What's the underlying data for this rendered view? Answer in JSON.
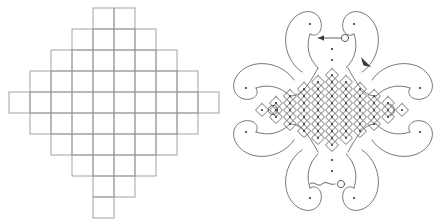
{
  "figure": {
    "title": "Stepped square grid and kolam loop design",
    "background_color": "#ffffff",
    "width": 443,
    "height": 222,
    "panel_count": 2
  },
  "left_panel": {
    "name": "stepped-square-grid",
    "description": "Diamond-shaped stepped arrangement of unit squares",
    "line_color": "#9a9a9a",
    "cell_size": 21,
    "origin_x": 9,
    "origin_y": 8,
    "columns": 10,
    "rows": 10,
    "row_spans": [
      {
        "row": 0,
        "start_col": 4,
        "span": 2
      },
      {
        "row": 1,
        "start_col": 3,
        "span": 4
      },
      {
        "row": 2,
        "start_col": 2,
        "span": 6
      },
      {
        "row": 3,
        "start_col": 1,
        "span": 8
      },
      {
        "row": 4,
        "start_col": 0,
        "span": 10
      },
      {
        "row": 5,
        "start_col": 1,
        "span": 8
      },
      {
        "row": 6,
        "start_col": 2,
        "span": 6
      },
      {
        "row": 7,
        "start_col": 3,
        "span": 4
      },
      {
        "row": 8,
        "start_col": 4,
        "span": 2
      },
      {
        "row": 9,
        "start_col": 4,
        "span": 1
      }
    ]
  },
  "right_panel": {
    "name": "kolam-loop-design",
    "description": "Four-lobed kolam with central diamond dot lattice",
    "stroke_color": "#555555",
    "dot_color": "#3a3a3a",
    "center_x": 110,
    "center_y": 110,
    "lattice": {
      "dot_spacing": 14,
      "diamond_rows": [
        1,
        3,
        5,
        7,
        9,
        11,
        9,
        7,
        5,
        3,
        1
      ],
      "dot_count": 61
    },
    "lobes": [
      {
        "name": "lobe-top",
        "angle": 270,
        "tip_dots": 2
      },
      {
        "name": "lobe-right",
        "angle": 0,
        "tip_dots": 2
      },
      {
        "name": "lobe-bottom",
        "angle": 90,
        "tip_dots": 2
      },
      {
        "name": "lobe-left",
        "angle": 180,
        "tip_dots": 2
      }
    ],
    "markers": [
      {
        "name": "start-marker-top",
        "type": "arrow-to-circle",
        "x": 110,
        "y": 38
      },
      {
        "name": "start-marker-bottom",
        "type": "squiggle-to-circle",
        "x": 108,
        "y": 182
      },
      {
        "name": "eye-marker-left",
        "type": "open-circle",
        "x": 51,
        "y": 110
      },
      {
        "name": "eye-marker-right",
        "type": "crescent",
        "x": 170,
        "y": 110
      },
      {
        "name": "direction-arrow",
        "type": "arrowhead",
        "x": 144,
        "y": 62
      }
    ]
  }
}
